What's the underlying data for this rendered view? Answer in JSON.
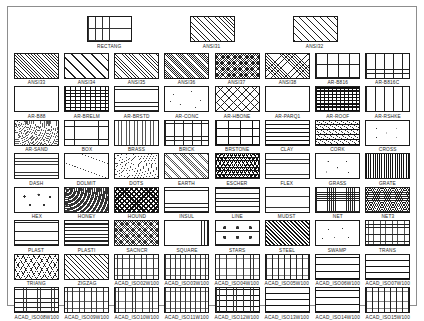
{
  "document": {
    "title": "AutoCAD Hatch Pattern Reference Chart",
    "frame_color": "#8d8d8d",
    "background_color": "#ffffff",
    "swatch_border_color": "#1a1a1a",
    "label_color": "#1d1d1d"
  },
  "rows": [
    {
      "row_name": "top-row",
      "cells": [
        {
          "label": "RECTANG",
          "pattern": "p-rectang"
        },
        {
          "label": "ANSI31",
          "pattern": "p-ansi31"
        },
        {
          "label": "ANSI32",
          "pattern": "p-ansi32"
        }
      ]
    },
    {
      "row_name": "row-ansi",
      "cells": [
        {
          "label": "ANSI33",
          "pattern": "p-ansi33"
        },
        {
          "label": "ANSI34",
          "pattern": "p-ansi34"
        },
        {
          "label": "ANSI35",
          "pattern": "p-ansi35"
        },
        {
          "label": "ANSI36",
          "pattern": "p-ansi36"
        },
        {
          "label": "ANSI37",
          "pattern": "p-ansi37"
        },
        {
          "label": "ANSI38",
          "pattern": "p-ansi38"
        },
        {
          "label": "AR-B816",
          "pattern": "p-brick-l"
        },
        {
          "label": "AR-B816C",
          "pattern": "p-brick-m"
        }
      ]
    },
    {
      "row_name": "row-ar-1",
      "cells": [
        {
          "label": "AR-B88",
          "pattern": "p-brick-s"
        },
        {
          "label": "AR-BRELM",
          "pattern": "p-brickdark"
        },
        {
          "label": "AR-BRSTD",
          "pattern": "p-brick-m"
        },
        {
          "label": "AR-CONC",
          "pattern": "p-conc"
        },
        {
          "label": "AR-HBONE",
          "pattern": "p-hbone"
        },
        {
          "label": "AR-PARQ1",
          "pattern": "p-parq"
        },
        {
          "label": "AR-ROOF",
          "pattern": "p-roof"
        },
        {
          "label": "AR-RSHKE",
          "pattern": "p-shake"
        }
      ]
    },
    {
      "row_name": "row-ar-2",
      "cells": [
        {
          "label": "AR-SAND",
          "pattern": "p-sand"
        },
        {
          "label": "BOX",
          "pattern": "p-box"
        },
        {
          "label": "BRASS",
          "pattern": "p-brass"
        },
        {
          "label": "BRICK",
          "pattern": "p-brick-m"
        },
        {
          "label": "BRSTONE",
          "pattern": "p-brstone"
        },
        {
          "label": "CLAY",
          "pattern": "p-clay"
        },
        {
          "label": "CORK",
          "pattern": "p-cork"
        },
        {
          "label": "CROSS",
          "pattern": "p-cross"
        }
      ]
    },
    {
      "row_name": "row-dash",
      "cells": [
        {
          "label": "DASH",
          "pattern": "p-dash"
        },
        {
          "label": "DOLMIT",
          "pattern": "p-dolmit"
        },
        {
          "label": "DOTS",
          "pattern": "p-dots"
        },
        {
          "label": "EARTH",
          "pattern": "p-earth"
        },
        {
          "label": "ESCHER",
          "pattern": "p-escher"
        },
        {
          "label": "FLEX",
          "pattern": "p-flex"
        },
        {
          "label": "GRASS",
          "pattern": "p-grass"
        },
        {
          "label": "GRATE",
          "pattern": "p-grate"
        }
      ]
    },
    {
      "row_name": "row-hex",
      "cells": [
        {
          "label": "HEX",
          "pattern": "p-hex"
        },
        {
          "label": "HONEY",
          "pattern": "p-honey"
        },
        {
          "label": "HOUND",
          "pattern": "p-hound"
        },
        {
          "label": "INSUL",
          "pattern": "p-insul"
        },
        {
          "label": "LINE",
          "pattern": "p-line"
        },
        {
          "label": "MUDST",
          "pattern": "p-mudst"
        },
        {
          "label": "NET",
          "pattern": "p-net"
        },
        {
          "label": "NET3",
          "pattern": "p-net3"
        }
      ]
    },
    {
      "row_name": "row-plast",
      "cells": [
        {
          "label": "PLAST",
          "pattern": "p-plast"
        },
        {
          "label": "PLASTI",
          "pattern": "p-plasti"
        },
        {
          "label": "SACNCR",
          "pattern": "p-sacncr"
        },
        {
          "label": "SQUARE",
          "pattern": "p-square"
        },
        {
          "label": "STARS",
          "pattern": "p-stars"
        },
        {
          "label": "STEEL",
          "pattern": "p-steel"
        },
        {
          "label": "SWAMP",
          "pattern": "p-swamp"
        },
        {
          "label": "TRANS",
          "pattern": "p-trans"
        }
      ]
    },
    {
      "row_name": "row-triang",
      "cells": [
        {
          "label": "TRIANG",
          "pattern": "p-triang"
        },
        {
          "label": "ZIGZAG",
          "pattern": "p-zigzag"
        },
        {
          "label": "ACAD_ISO02W100",
          "pattern": "p-iso-a"
        },
        {
          "label": "ACAD_ISO03W100",
          "pattern": "p-iso-b"
        },
        {
          "label": "ACAD_ISO04W100",
          "pattern": "p-iso-c"
        },
        {
          "label": "ACAD_ISO05W100",
          "pattern": "p-iso-d"
        },
        {
          "label": "ACAD_ISO06W100",
          "pattern": "p-iso-e"
        },
        {
          "label": "ACAD_ISO07W100",
          "pattern": "p-iso-f"
        }
      ]
    },
    {
      "row_name": "row-iso",
      "cells": [
        {
          "label": "ACAD_ISO08W100",
          "pattern": "p-iso-g"
        },
        {
          "label": "ACAD_ISO09W100",
          "pattern": "p-iso-a"
        },
        {
          "label": "ACAD_ISO10W100",
          "pattern": "p-iso-c"
        },
        {
          "label": "ACAD_ISO11W100",
          "pattern": "p-iso-b"
        },
        {
          "label": "ACAD_ISO12W100",
          "pattern": "p-iso-h"
        },
        {
          "label": "ACAD_ISO13W100",
          "pattern": "p-iso-f"
        },
        {
          "label": "ACAD_ISO14W100",
          "pattern": "p-iso-e"
        },
        {
          "label": "ACAD_ISO15W100",
          "pattern": "p-iso-d"
        }
      ]
    }
  ]
}
